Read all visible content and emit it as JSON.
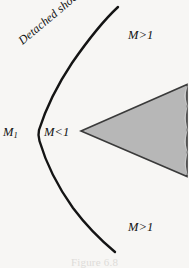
{
  "figure": {
    "domain": "scientific-diagram",
    "background_color": "#f7f6f4",
    "width": 189,
    "height": 268,
    "caption": "Figure 6.8",
    "caption_cropped": true
  },
  "labels": {
    "upstream_mach": "M",
    "upstream_mach_subscript": "1",
    "subsonic_region": "M<1",
    "supersonic_top": "M>1",
    "supersonic_bottom": "M>1",
    "shock_name": "Detached shock"
  },
  "shapes": {
    "shock_wave": {
      "name": "detached-shock-curve",
      "type": "open-curve",
      "stroke": "#141414",
      "stroke_width": 2.4,
      "fill": "none",
      "points": [
        [
          118,
          7
        ],
        [
          96,
          31
        ],
        [
          75,
          58
        ],
        [
          57,
          88
        ],
        [
          45,
          112
        ],
        [
          38,
          133
        ],
        [
          44,
          158
        ],
        [
          57,
          185
        ],
        [
          75,
          211
        ],
        [
          96,
          234
        ],
        [
          115,
          252
        ]
      ]
    },
    "wedge_body": {
      "name": "wedge-body",
      "type": "polygon",
      "fill": "#b7b7b7",
      "stroke": "#3a3a3a",
      "stroke_width": 1.6,
      "points": [
        [
          81,
          131
        ],
        [
          187,
          84
        ],
        [
          187,
          177
        ]
      ]
    }
  },
  "colors": {
    "background": "#f7f6f4",
    "shock_stroke": "#141414",
    "wedge_fill": "#b7b7b7",
    "wedge_stroke": "#3a3a3a",
    "text": "#121212"
  }
}
